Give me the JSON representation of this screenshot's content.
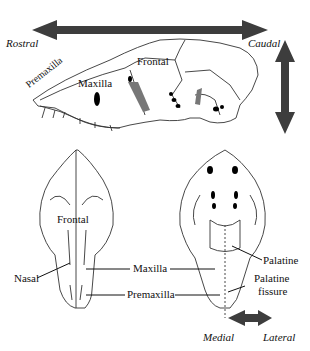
{
  "diagram": {
    "colors": {
      "arrow": "#3d3d3d",
      "line": "#333333",
      "shade": "#777777"
    },
    "directions": {
      "rostral": "Rostral",
      "caudal": "Caudal",
      "medial": "Medial",
      "lateral": "Lateral"
    },
    "lateral_view": {
      "labels": {
        "premaxilla": "Premaxilla",
        "maxilla": "Maxilla",
        "frontal": "Frontal"
      }
    },
    "dorsal_view": {
      "labels": {
        "frontal": "Frontal",
        "nasal": "Nasal"
      }
    },
    "shared_labels": {
      "maxilla": "Maxilla",
      "premaxilla": "Premaxilla"
    },
    "ventral_view": {
      "labels": {
        "palatine": "Palatine",
        "palatine_fissure_1": "Palatine",
        "palatine_fissure_2": "fissure"
      }
    }
  }
}
